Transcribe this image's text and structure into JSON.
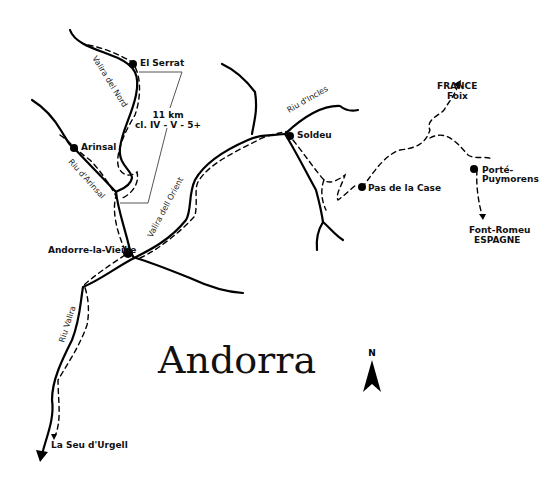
{
  "map": {
    "title": "Andorra",
    "north_label": "N",
    "route_info": {
      "distance": "11 km",
      "class": "cl. IV - V - 5+"
    },
    "towns": [
      {
        "name": "El Serrat"
      },
      {
        "name": "Arinsal"
      },
      {
        "name": "Andorre-la-Vieille"
      },
      {
        "name": "Soldeu"
      },
      {
        "name": "Pas de la Case"
      },
      {
        "name": "Porté-",
        "name2": "Puymorens"
      }
    ],
    "destinations": [
      {
        "line1": "FRANCE",
        "line2": "Foix"
      },
      {
        "line1": "Font-Romeu",
        "line2": "ESPAGNE"
      },
      {
        "line1": "La Seu d'Urgell"
      }
    ],
    "rivers": [
      {
        "name": "Valira del Nord"
      },
      {
        "name": "Riu d'Arinsal"
      },
      {
        "name": "Valira dell Orient"
      },
      {
        "name": "Riu d'Incles"
      },
      {
        "name": "Riu Valira"
      }
    ]
  }
}
